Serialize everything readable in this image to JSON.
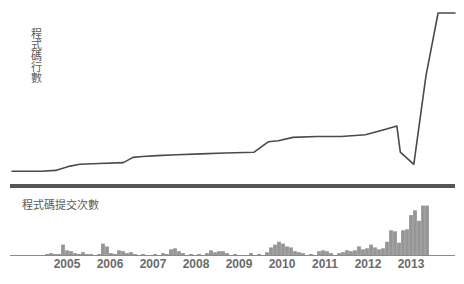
{
  "labels": {
    "loc_axis": "程式碼行數",
    "commits_title": "程式碼提交次數"
  },
  "colors": {
    "line": "#4a4a4a",
    "bar": "#969696",
    "axis": "#8a8a8a",
    "divider": "#555555",
    "text": "#5a5a5a",
    "tick_text": "#6b6b6b",
    "background": "#ffffff"
  },
  "chart_data": [
    {
      "type": "line",
      "title": "",
      "ylabel": "程式碼行數",
      "xlabel": "",
      "grid": false,
      "legend": null,
      "xlim": [
        2004.6,
        2013.75
      ],
      "ylim": [
        0,
        100
      ],
      "note": "Cumulative lines of code; long slow growth 2005-2012, a sharp drop in late 2012, then an extremely steep rise in 2013 flattening at the top.",
      "x": [
        2004.6,
        2005.2,
        2005.5,
        2005.8,
        2006.0,
        2006.4,
        2006.9,
        2007.1,
        2007.3,
        2007.6,
        2008.0,
        2008.5,
        2009.0,
        2009.6,
        2009.9,
        2010.1,
        2010.4,
        2010.9,
        2011.4,
        2011.9,
        2012.3,
        2012.55,
        2012.62,
        2012.9,
        2013.15,
        2013.4,
        2013.75
      ],
      "y": [
        5,
        5,
        5.5,
        8,
        9,
        9.5,
        10,
        13,
        13.5,
        14,
        14.5,
        15,
        15.5,
        16,
        22,
        22.5,
        24.5,
        25,
        25,
        26,
        29,
        31,
        16,
        9,
        60,
        96,
        96
      ]
    },
    {
      "type": "bar",
      "title": "程式碼提交次數",
      "xlabel": "",
      "ylabel": "",
      "grid": false,
      "legend": null,
      "xlim": [
        2004.6,
        2013.75
      ],
      "ylim": [
        0,
        60
      ],
      "note": "Monthly commit counts. Small sporadic activity 2005-2009, moderate bump in 2010, growing through 2011-2012, and a large burst peaking in 2013.",
      "categories": [
        "2005",
        "2006",
        "2007",
        "2008",
        "2009",
        "2010",
        "2011",
        "2012",
        "2013"
      ],
      "bar_width": 3.8,
      "bars": [
        {
          "x": 47,
          "h": 1
        },
        {
          "x": 51,
          "h": 2
        },
        {
          "x": 55,
          "h": 1
        },
        {
          "x": 59,
          "h": 1
        },
        {
          "x": 63,
          "h": 11
        },
        {
          "x": 67,
          "h": 5
        },
        {
          "x": 71,
          "h": 4
        },
        {
          "x": 75,
          "h": 2
        },
        {
          "x": 79,
          "h": 1
        },
        {
          "x": 83,
          "h": 3
        },
        {
          "x": 87,
          "h": 1
        },
        {
          "x": 91,
          "h": 1
        },
        {
          "x": 99,
          "h": 1
        },
        {
          "x": 103,
          "h": 12
        },
        {
          "x": 107,
          "h": 9
        },
        {
          "x": 111,
          "h": 2
        },
        {
          "x": 115,
          "h": 1
        },
        {
          "x": 119,
          "h": 5
        },
        {
          "x": 123,
          "h": 4
        },
        {
          "x": 127,
          "h": 2
        },
        {
          "x": 131,
          "h": 3
        },
        {
          "x": 135,
          "h": 1
        },
        {
          "x": 143,
          "h": 1
        },
        {
          "x": 155,
          "h": 1
        },
        {
          "x": 163,
          "h": 2
        },
        {
          "x": 167,
          "h": 1
        },
        {
          "x": 171,
          "h": 6
        },
        {
          "x": 175,
          "h": 7
        },
        {
          "x": 179,
          "h": 4
        },
        {
          "x": 183,
          "h": 2
        },
        {
          "x": 191,
          "h": 1
        },
        {
          "x": 199,
          "h": 1
        },
        {
          "x": 207,
          "h": 2
        },
        {
          "x": 211,
          "h": 5
        },
        {
          "x": 215,
          "h": 3
        },
        {
          "x": 219,
          "h": 4
        },
        {
          "x": 223,
          "h": 4
        },
        {
          "x": 227,
          "h": 2
        },
        {
          "x": 235,
          "h": 1
        },
        {
          "x": 251,
          "h": 2
        },
        {
          "x": 259,
          "h": 1
        },
        {
          "x": 267,
          "h": 3
        },
        {
          "x": 271,
          "h": 8
        },
        {
          "x": 275,
          "h": 11
        },
        {
          "x": 279,
          "h": 14
        },
        {
          "x": 283,
          "h": 12
        },
        {
          "x": 287,
          "h": 9
        },
        {
          "x": 291,
          "h": 8
        },
        {
          "x": 295,
          "h": 4
        },
        {
          "x": 299,
          "h": 3
        },
        {
          "x": 303,
          "h": 2
        },
        {
          "x": 311,
          "h": 1
        },
        {
          "x": 319,
          "h": 4
        },
        {
          "x": 323,
          "h": 5
        },
        {
          "x": 327,
          "h": 4
        },
        {
          "x": 331,
          "h": 2
        },
        {
          "x": 339,
          "h": 2
        },
        {
          "x": 343,
          "h": 3
        },
        {
          "x": 347,
          "h": 5
        },
        {
          "x": 351,
          "h": 4
        },
        {
          "x": 355,
          "h": 5
        },
        {
          "x": 359,
          "h": 9
        },
        {
          "x": 363,
          "h": 6
        },
        {
          "x": 367,
          "h": 7
        },
        {
          "x": 371,
          "h": 11
        },
        {
          "x": 375,
          "h": 8
        },
        {
          "x": 379,
          "h": 6
        },
        {
          "x": 383,
          "h": 7
        },
        {
          "x": 387,
          "h": 14
        },
        {
          "x": 391,
          "h": 26
        },
        {
          "x": 395,
          "h": 25
        },
        {
          "x": 399,
          "h": 13
        },
        {
          "x": 403,
          "h": 26
        },
        {
          "x": 407,
          "h": 27
        },
        {
          "x": 411,
          "h": 42
        },
        {
          "x": 415,
          "h": 47
        },
        {
          "x": 419,
          "h": 36
        },
        {
          "x": 423,
          "h": 52
        },
        {
          "x": 427,
          "h": 52
        }
      ]
    }
  ],
  "axis": {
    "ticks": [
      {
        "label": "2005",
        "x": 67
      },
      {
        "label": "2006",
        "x": 110
      },
      {
        "label": "2007",
        "x": 153
      },
      {
        "label": "2008",
        "x": 196
      },
      {
        "label": "2009",
        "x": 239
      },
      {
        "label": "2010",
        "x": 282
      },
      {
        "label": "2011",
        "x": 325
      },
      {
        "label": "2012",
        "x": 368
      },
      {
        "label": "2013",
        "x": 411
      }
    ]
  }
}
